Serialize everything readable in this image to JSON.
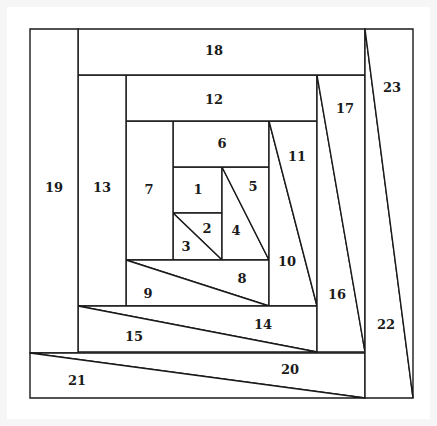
{
  "diagram": {
    "title": "",
    "type": "log-cabin quilt block (spiral piecing)",
    "stroke_color": "#1a1a1a",
    "fill_color": "#ffffff",
    "pieces": [
      {
        "id": "1",
        "label": "1",
        "points": "173,167 222,167 222,213 173,213",
        "lx": 198,
        "ly": 189
      },
      {
        "id": "2",
        "label": "2",
        "points": "173,213 222,213 222,260",
        "lx": 207,
        "ly": 228
      },
      {
        "id": "3",
        "label": "3",
        "points": "173,213 222,260 173,260",
        "lx": 186,
        "ly": 246
      },
      {
        "id": "4",
        "label": "4",
        "points": "222,167 269,260 222,260",
        "lx": 236,
        "ly": 230
      },
      {
        "id": "5",
        "label": "5",
        "points": "222,167 269,167 269,260",
        "lx": 253,
        "ly": 186
      },
      {
        "id": "6",
        "label": "6",
        "points": "173,121 269,121 269,167 173,167",
        "lx": 222,
        "ly": 143
      },
      {
        "id": "7",
        "label": "7",
        "points": "126,121 173,121 173,260 126,260",
        "lx": 149,
        "ly": 189
      },
      {
        "id": "8",
        "label": "8",
        "points": "126,260 269,260 269,306",
        "lx": 242,
        "ly": 278
      },
      {
        "id": "9",
        "label": "9",
        "points": "126,260 269,306 126,306",
        "lx": 148,
        "ly": 293
      },
      {
        "id": "10",
        "label": "10",
        "points": "269,121 317,306 269,306",
        "lx": 287,
        "ly": 261
      },
      {
        "id": "11",
        "label": "11",
        "points": "269,121 317,121 317,306",
        "lx": 297,
        "ly": 156
      },
      {
        "id": "12",
        "label": "12",
        "points": "126,75 317,75 317,121 126,121",
        "lx": 214,
        "ly": 99
      },
      {
        "id": "13",
        "label": "13",
        "points": "78,75 126,75 126,306 78,306",
        "lx": 102,
        "ly": 187
      },
      {
        "id": "14",
        "label": "14",
        "points": "78,306 317,306 317,352",
        "lx": 263,
        "ly": 324
      },
      {
        "id": "15",
        "label": "15",
        "points": "78,306 317,352 78,352",
        "lx": 134,
        "ly": 336
      },
      {
        "id": "16",
        "label": "16",
        "points": "317,75 365,352 317,352",
        "lx": 337,
        "ly": 294
      },
      {
        "id": "17",
        "label": "17",
        "points": "317,75 365,75 365,352",
        "lx": 345,
        "ly": 108
      },
      {
        "id": "18",
        "label": "18",
        "points": "78,29 365,29 365,75 78,75",
        "lx": 214,
        "ly": 50
      },
      {
        "id": "19",
        "label": "19",
        "points": "30,29 78,29 78,353 30,353",
        "lx": 54,
        "ly": 187
      },
      {
        "id": "20",
        "label": "20",
        "points": "30,353 365,353 365,398",
        "lx": 290,
        "ly": 369
      },
      {
        "id": "21",
        "label": "21",
        "points": "30,353 365,398 30,398",
        "lx": 77,
        "ly": 380
      },
      {
        "id": "22",
        "label": "22",
        "points": "365,29 413,398 365,398",
        "lx": 386,
        "ly": 324
      },
      {
        "id": "23",
        "label": "23",
        "points": "365,29 413,29 413,398",
        "lx": 392,
        "ly": 87
      }
    ]
  }
}
